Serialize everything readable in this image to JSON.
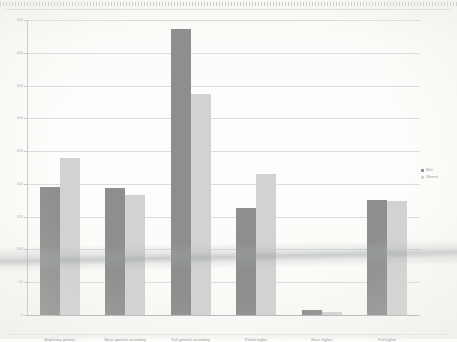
{
  "chart_data": {
    "type": "bar",
    "title": "",
    "xlabel": "",
    "ylabel": "",
    "ylim": [
      0,
      450
    ],
    "ytick_step": 50,
    "grid": true,
    "legend_position": "right",
    "categories": [
      "Beginning general",
      "Basic general secondary",
      "Full general secondary",
      "Partial higher",
      "Basic higher",
      "Full higher"
    ],
    "ytick_labels": [
      "450",
      "400",
      "350",
      "300",
      "250",
      "200",
      "150",
      "100",
      "50",
      "0"
    ],
    "series": [
      {
        "name": "Men",
        "color": "#8e8e8e",
        "values": [
          195,
          193,
          437,
          163,
          8,
          176
        ]
      },
      {
        "name": "Women",
        "color": "#d2d2d2",
        "values": [
          240,
          183,
          337,
          215,
          5,
          174
        ]
      }
    ]
  },
  "legend": {
    "items": [
      {
        "label": "Men"
      },
      {
        "label": "Women"
      }
    ]
  }
}
